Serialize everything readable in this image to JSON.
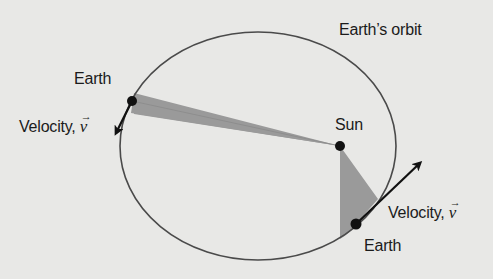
{
  "diagram": {
    "labels": {
      "orbit": "Earth’s orbit",
      "earth_left": "Earth",
      "velocity_left_prefix": "Velocity, ",
      "velocity_left_symbol": "v",
      "sun": "Sun",
      "velocity_right_prefix": "Velocity, ",
      "velocity_right_symbol": "v",
      "earth_right": "Earth",
      "vector_arrow": "→"
    },
    "colors": {
      "background": "#e8e8e6",
      "orbit_stroke": "#4a4a4a",
      "shaded_area": "#9a9a9a",
      "dot": "#111111",
      "arrow": "#111111",
      "text": "#1b1b1b"
    },
    "geometry": {
      "orbit": {
        "cx": 258,
        "cy": 146,
        "rx": 138,
        "ry": 114
      },
      "sun": {
        "x": 340,
        "y": 146
      },
      "earth_left": {
        "x": 132,
        "y": 101
      },
      "earth_right": {
        "x": 356,
        "y": 224
      },
      "velocity_left_tip": {
        "x": 115,
        "y": 135
      },
      "velocity_right_tip": {
        "x": 423,
        "y": 161
      }
    }
  }
}
